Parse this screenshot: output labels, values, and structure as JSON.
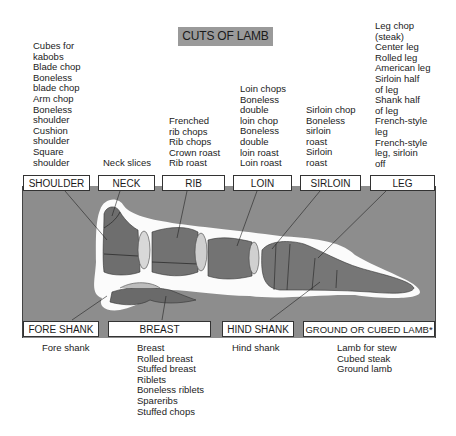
{
  "title": "CUTS OF LAMB",
  "cuts_top": [
    {
      "label": "SHOULDER",
      "items": [
        "Cubes for",
        "kabobs",
        "Blade chop",
        "Boneless",
        "blade chop",
        "Arm chop",
        "Boneless",
        "shoulder",
        "Cushion",
        "shoulder",
        "Square",
        "shoulder"
      ]
    },
    {
      "label": "NECK",
      "items": [
        "Neck slices"
      ]
    },
    {
      "label": "RIB",
      "items": [
        "Frenched",
        "rib chops",
        "Rib chops",
        "Crown roast",
        "Rib roast"
      ]
    },
    {
      "label": "LOIN",
      "items": [
        "Loin chops",
        "Boneless",
        "double",
        "loin chop",
        "Boneless",
        "double",
        "loin roast",
        "Loin roast"
      ]
    },
    {
      "label": "SIRLOIN",
      "items": [
        "Sirloin chop",
        "Boneless",
        "sirloin",
        "roast",
        "Sirloin",
        "roast"
      ]
    },
    {
      "label": "LEG",
      "items": [
        "Leg chop",
        "(steak)",
        "Center leg",
        "Rolled leg",
        "American leg",
        "Sirloin half",
        "of leg",
        "Shank half",
        "of leg",
        "French-style",
        "leg",
        "French-style",
        "leg, sirloin",
        "off"
      ]
    }
  ],
  "cuts_bottom": [
    {
      "label": "FORE SHANK",
      "items": [
        "Fore shank"
      ]
    },
    {
      "label": "BREAST",
      "items": [
        "Breast",
        "Rolled breast",
        "Stuffed breast",
        "Riblets",
        "Boneless riblets",
        "Spareribs",
        "Stuffed chops"
      ]
    },
    {
      "label": "HIND SHANK",
      "items": [
        "Hind shank"
      ]
    },
    {
      "label": "GROUND OR CUBED LAMB*",
      "items": [
        "Lamb for stew",
        "Cubed steak",
        "Ground lamb"
      ]
    }
  ],
  "colors": {
    "panel": "#8d8d8d",
    "title_bg": "#9a9a9a",
    "meat": "#6e6e6e",
    "halo": "#ffffff"
  }
}
